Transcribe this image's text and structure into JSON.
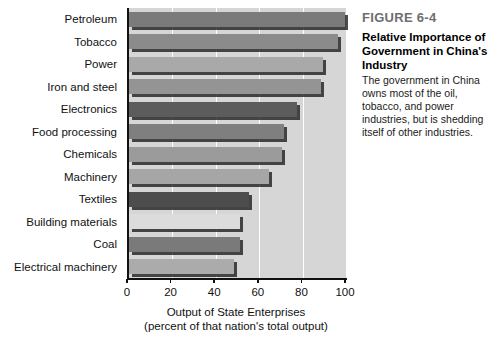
{
  "caption": {
    "figure_number": "FIGURE 6-4",
    "title": "Relative Importance of Government in China's Industry",
    "body": "The government in China owns most of the oil, tobacco, and power industries, but is shedding itself of other industries."
  },
  "chart_data": {
    "type": "bar",
    "orientation": "horizontal",
    "title": "Relative Importance of Government in China's Industry",
    "xlabel": "Output of State Enterprises",
    "xlabel_sub": "(percent of that nation's total output)",
    "ylabel": "",
    "xlim": [
      0,
      100
    ],
    "xticks": [
      0,
      20,
      40,
      60,
      80,
      100
    ],
    "xtick_labels": [
      "0",
      "20",
      "40",
      "60",
      "80",
      "100"
    ],
    "grid": "vertical-white-gridlines",
    "legend": "none",
    "plot_background": "#d6d6d6",
    "categories": [
      "Petroleum",
      "Tobacco",
      "Power",
      "Iron and steel",
      "Electronics",
      "Food processing",
      "Chemicals",
      "Machinery",
      "Textiles",
      "Building materials",
      "Coal",
      "Electrical machinery"
    ],
    "values": [
      99,
      96,
      89,
      88,
      77,
      71,
      70,
      64,
      55,
      51,
      51,
      48
    ],
    "bar_colors": [
      "#7b7b7b",
      "#8b8b8b",
      "#a9a9a9",
      "#949494",
      "#5c5c5c",
      "#7f7f7f",
      "#9b9b9b",
      "#a6a6a6",
      "#4d4d4d",
      "#dcdcdc",
      "#7a7a7a",
      "#ababab"
    ]
  }
}
